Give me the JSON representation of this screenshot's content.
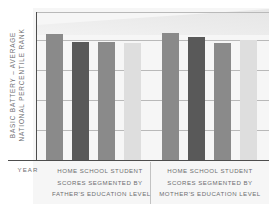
{
  "chart_data": {
    "type": "bar",
    "title": "",
    "subtitle": "",
    "ylabel_line1": "BASIC BATTERY – AVERAGE",
    "ylabel_line2": "NATIONAL PERCENTILE RANK",
    "xlabel": "",
    "ylim": [
      0,
      99
    ],
    "yticks": [
      0,
      20,
      40,
      60,
      80,
      99
    ],
    "ytick_labels": [
      "0",
      "20",
      "40",
      "60",
      "80",
      "99"
    ],
    "grid": true,
    "legend_position": "none",
    "x_axis_corner_label": "YEAR",
    "groups": [
      {
        "label_lines": [
          "HOME SCHOOL STUDENT",
          "SCORES SEGMENTED BY",
          "FATHER'S EDUCATION LEVEL"
        ],
        "bars": [
          {
            "value": 84,
            "color": "#8a8a8a"
          },
          {
            "value": 79,
            "color": "#595959"
          },
          {
            "value": 79,
            "color": "#8a8a8a"
          },
          {
            "value": 78,
            "color": "#dedede"
          }
        ]
      },
      {
        "label_lines": [
          "HOME SCHOOL STUDENT",
          "SCORES SEGMENTED BY",
          "MOTHER'S EDUCATION LEVEL"
        ],
        "bars": [
          {
            "value": 85,
            "color": "#8a8a8a"
          },
          {
            "value": 82,
            "color": "#595959"
          },
          {
            "value": 78,
            "color": "#8a8a8a"
          },
          {
            "value": 80,
            "color": "#dedede"
          }
        ]
      }
    ],
    "categories": [
      "Father group bar 1",
      "Father group bar 2",
      "Father group bar 3",
      "Father group bar 4",
      "Mother group bar 1",
      "Mother group bar 2",
      "Mother group bar 3",
      "Mother group bar 4"
    ],
    "values": [
      84,
      79,
      79,
      78,
      85,
      82,
      78,
      80
    ],
    "colors": {
      "bar_medium": "#8a8a8a",
      "bar_dark": "#595959",
      "bar_light": "#dedede",
      "axis": "#4d4d4d",
      "gridline": "#b9b9b9",
      "text": "#6d6e71",
      "panel": "#f6f6f6"
    }
  }
}
